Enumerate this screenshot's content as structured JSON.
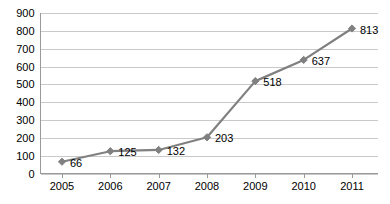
{
  "chart_data": {
    "type": "line",
    "title": "",
    "subtitle": "",
    "xlabel": "",
    "ylabel": "",
    "categories": [
      "2005",
      "2006",
      "2007",
      "2008",
      "2009",
      "2010",
      "2011"
    ],
    "values": [
      66,
      125,
      132,
      203,
      518,
      637,
      813
    ],
    "data_labels": [
      "66",
      "125",
      "132",
      "203",
      "518",
      "637",
      "813"
    ],
    "series": [
      {
        "name": "",
        "values": [
          66,
          125,
          132,
          203,
          518,
          637,
          813
        ]
      }
    ],
    "ylim": [
      0,
      900
    ],
    "ytick_step": 100,
    "yticks": [
      0,
      100,
      200,
      300,
      400,
      500,
      600,
      700,
      800,
      900
    ],
    "ytick_labels": [
      "0",
      "100",
      "200",
      "300",
      "400",
      "500",
      "600",
      "700",
      "800",
      "900"
    ],
    "xtick_labels": [
      "2005",
      "2006",
      "2007",
      "2008",
      "2009",
      "2010",
      "2011"
    ],
    "grid": "horizontal",
    "legend": "none",
    "marker": "diamond",
    "colors": {
      "line": "#808080",
      "marker": "#808080",
      "gridline": "#c9c9c9",
      "axis": "#9a9a9a",
      "text": "#000000",
      "background": "#ffffff"
    }
  }
}
